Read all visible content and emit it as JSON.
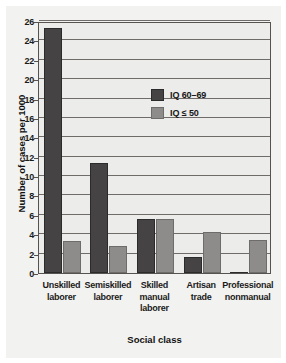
{
  "chart_data": {
    "type": "bar",
    "title": "",
    "xlabel": "Social class",
    "ylabel": "Number of cases per 1000",
    "categories": [
      "Unskilled laborer",
      "Semiskilled laborer",
      "Skilled manual laborer",
      "Artisan trade",
      "Professional nonmanual"
    ],
    "category_lines": [
      [
        "Unskilled",
        "laborer"
      ],
      [
        "Semiskilled",
        "laborer"
      ],
      [
        "Skilled",
        "manual",
        "laborer"
      ],
      [
        "Artisan",
        "trade"
      ],
      [
        "Professional",
        "nonmanual"
      ]
    ],
    "series": [
      {
        "name": "IQ 60–69",
        "color": "#454344",
        "values": [
          25.3,
          11.4,
          5.6,
          1.7,
          0.15
        ]
      },
      {
        "name": "IQ ≤ 50",
        "color": "#8d8c8a",
        "values": [
          3.3,
          2.8,
          5.6,
          4.2,
          3.4
        ]
      }
    ],
    "ylim": [
      0,
      26
    ],
    "yticks": [
      0,
      2,
      4,
      6,
      8,
      10,
      12,
      14,
      16,
      18,
      20,
      22,
      24,
      26
    ],
    "ytick_labels": [
      "0",
      "2",
      "4",
      "6",
      "8",
      "10",
      "12",
      "14",
      "16",
      "18",
      "20",
      "22",
      "24",
      "26"
    ],
    "grid": true,
    "legend_position": "upper-center"
  }
}
